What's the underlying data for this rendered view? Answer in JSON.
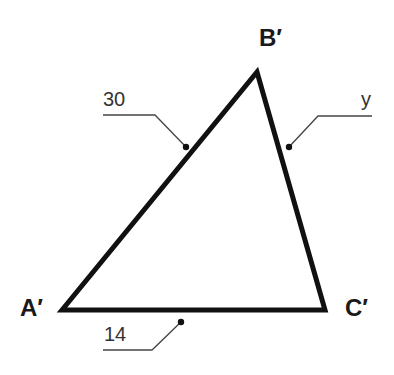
{
  "diagram": {
    "type": "triangle",
    "vertices": [
      {
        "id": "A",
        "label": "A′",
        "x": 62,
        "y": 310
      },
      {
        "id": "B",
        "label": "B′",
        "x": 257,
        "y": 72
      },
      {
        "id": "C",
        "label": "C′",
        "x": 325,
        "y": 310
      }
    ],
    "sides": [
      {
        "from": "A",
        "to": "B",
        "label": "30"
      },
      {
        "from": "B",
        "to": "C",
        "label": "y"
      },
      {
        "from": "A",
        "to": "C",
        "label": "14"
      }
    ],
    "colors": {
      "stroke": "#111111",
      "leader": "#444444",
      "text": "#1a1a1a"
    }
  }
}
